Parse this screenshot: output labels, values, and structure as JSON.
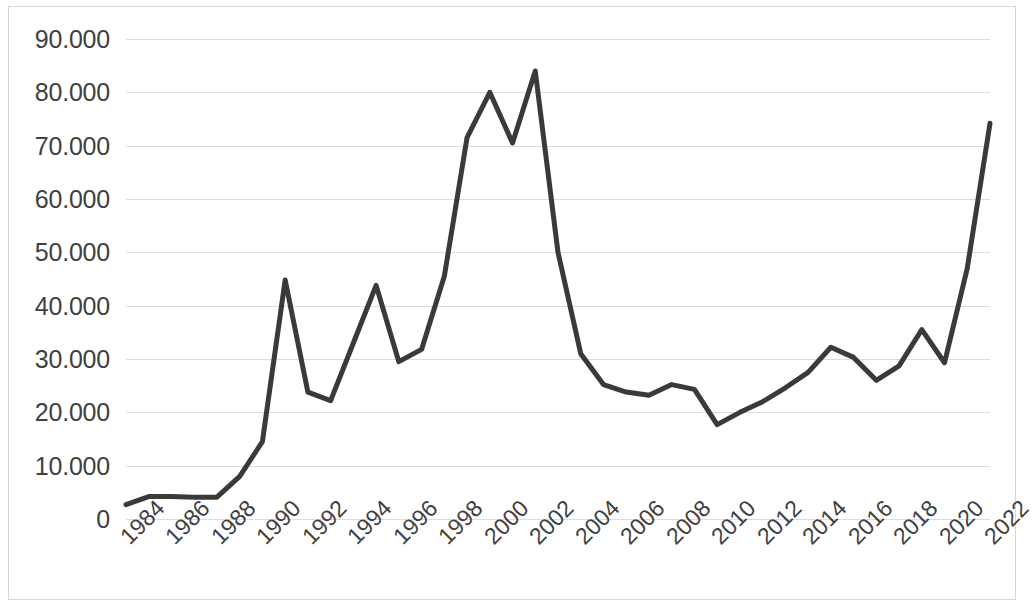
{
  "chart_data": {
    "type": "line",
    "title": "",
    "subtitle": "",
    "xlabel": "",
    "ylabel": "",
    "xlim": [
      1984,
      2022
    ],
    "ylim": [
      0,
      90000
    ],
    "grid": "horizontal",
    "legend": "none",
    "y_ticks": [
      "0",
      "10.000",
      "20.000",
      "30.000",
      "40.000",
      "50.000",
      "60.000",
      "70.000",
      "80.000",
      "90.000"
    ],
    "y_tick_values": [
      0,
      10000,
      20000,
      30000,
      40000,
      50000,
      60000,
      70000,
      80000,
      90000
    ],
    "x_tick_labels": [
      "1984",
      "1986",
      "1988",
      "1990",
      "1992",
      "1994",
      "1996",
      "1998",
      "2000",
      "2002",
      "2004",
      "2006",
      "2008",
      "2010",
      "2012",
      "2014",
      "2016",
      "2018",
      "2020",
      "2022"
    ],
    "x_tick_values": [
      1984,
      1986,
      1988,
      1990,
      1992,
      1994,
      1996,
      1998,
      2000,
      2002,
      2004,
      2006,
      2008,
      2010,
      2012,
      2014,
      2016,
      2018,
      2020,
      2022
    ],
    "x_tick_rotation": -45,
    "series": [
      {
        "name": "series-1",
        "color": "#3a3a3a",
        "line_width": 5,
        "marker": "none",
        "x": [
          1984,
          1985,
          1986,
          1987,
          1988,
          1989,
          1990,
          1991,
          1992,
          1993,
          1994,
          1995,
          1996,
          1997,
          1998,
          1999,
          2000,
          2001,
          2002,
          2003,
          2004,
          2005,
          2006,
          2007,
          2008,
          2009,
          2010,
          2011,
          2012,
          2013,
          2014,
          2015,
          2016,
          2017,
          2018,
          2019,
          2020,
          2021,
          2022
        ],
        "values": [
          2700,
          4200,
          4200,
          4100,
          4100,
          8000,
          14500,
          44800,
          23800,
          22200,
          33000,
          43800,
          29500,
          31800,
          45500,
          71500,
          80000,
          70500,
          84000,
          50000,
          31000,
          25200,
          23800,
          23200,
          25200,
          24300,
          17700,
          20000,
          22000,
          24600,
          27500,
          32200,
          30300,
          26000,
          28700,
          35500,
          29300,
          47000,
          74200
        ]
      }
    ]
  },
  "axes": {
    "plot_left_px": 126,
    "plot_top_px": 39,
    "plot_width_px": 864,
    "plot_height_px": 480
  }
}
